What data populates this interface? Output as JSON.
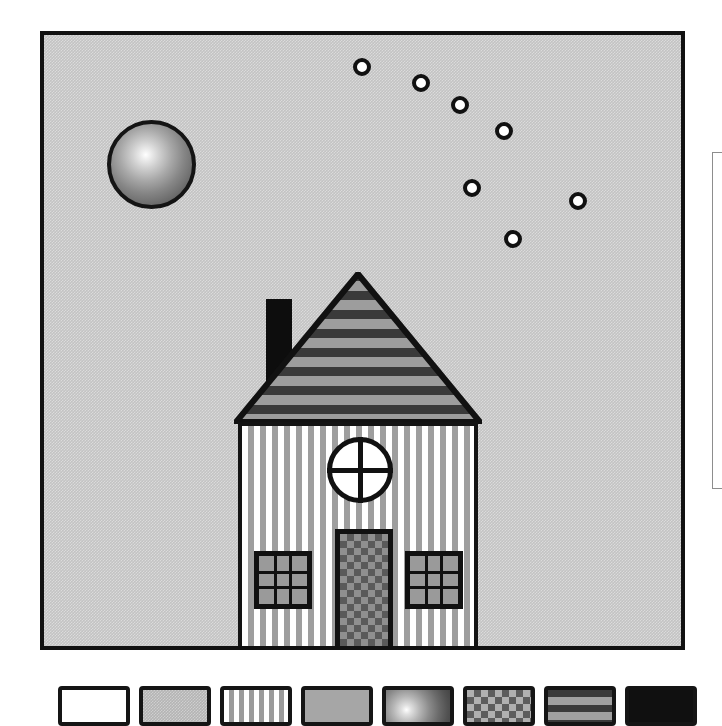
{
  "app": {
    "title": "Drawing Canvas",
    "canvas_bg_color": "#c3c3c3",
    "outline_color": "#111111",
    "paper_color": "#ffffff"
  },
  "canvas": {
    "name": "house-scene",
    "description": "House with striped roof, vertical-striped walls, checkered door, sun sphere and arc of bubbles",
    "bounds": {
      "x": 40,
      "y": 31,
      "width": 645,
      "height": 619
    }
  },
  "scene": {
    "sphere": {
      "label": "sun-sphere",
      "center_x": 107,
      "center_y": 129,
      "radius": 44,
      "fill": "radial-gradient",
      "highlight_color": "#ffffff",
      "shadow_color": "#4c4c4c",
      "stroke": "#141414"
    },
    "bubbles": {
      "label": "bubble-arc",
      "count": 7,
      "fill": "#ffffff",
      "stroke": "#111111",
      "radius": 9,
      "points": [
        {
          "id": "bubble-1",
          "x": 358,
          "y": 63
        },
        {
          "id": "bubble-2",
          "x": 417,
          "y": 79
        },
        {
          "id": "bubble-3",
          "x": 456,
          "y": 101
        },
        {
          "id": "bubble-4",
          "x": 500,
          "y": 127
        },
        {
          "id": "bubble-5",
          "x": 468,
          "y": 184
        },
        {
          "id": "bubble-6",
          "x": 574,
          "y": 197
        },
        {
          "id": "bubble-7",
          "x": 509,
          "y": 235
        }
      ]
    },
    "house": {
      "label": "house",
      "roof": {
        "label": "roof",
        "pattern": "horizontal-stripes",
        "dark_color": "#3a3a3a",
        "light_color": "#9d9d9d",
        "apex_x": 361,
        "apex_y": 268,
        "base_y": 420,
        "left_x": 230,
        "right_x": 478
      },
      "chimney": {
        "label": "chimney",
        "fill": "#0d0d0d",
        "x": 262,
        "y": 295,
        "width": 26,
        "height": 95
      },
      "walls": {
        "label": "house-body",
        "pattern": "vertical-stripes",
        "stripe_color": "#9e9e9e",
        "gap_color": "#ffffff",
        "x": 234,
        "y": 418,
        "width": 240,
        "height": 232
      },
      "round_window": {
        "label": "round-window",
        "center_x": 356,
        "center_y": 468,
        "radius": 33,
        "mullions": "cross",
        "fill": "#ffffff"
      },
      "door": {
        "label": "front-door",
        "pattern": "checkerboard",
        "light_color": "#8f8f8f",
        "dark_color": "#5a5a5a",
        "x": 331,
        "y": 525,
        "width": 58,
        "height": 125
      },
      "windows": [
        {
          "label": "window-left",
          "x": 250,
          "y": 547,
          "width": 58,
          "height": 58,
          "panes": 9,
          "fill": "#9a9a9a"
        },
        {
          "label": "window-right",
          "x": 401,
          "y": 547,
          "width": 58,
          "height": 58,
          "panes": 9,
          "fill": "#9a9a9a"
        }
      ]
    }
  },
  "palette": {
    "label": "pattern-palette",
    "swatch_count": 8,
    "swatches": [
      {
        "id": "swatch-solid-white",
        "name": "solid-white",
        "x": 58,
        "color": "#ffffff"
      },
      {
        "id": "swatch-light-gray",
        "name": "light-gray-grain",
        "x": 139,
        "color": "#b4b4b4"
      },
      {
        "id": "swatch-vstripes",
        "name": "vertical-stripes",
        "x": 220,
        "color": "#9b9b9b"
      },
      {
        "id": "swatch-mid-gray",
        "name": "mid-gray",
        "x": 301,
        "color": "#a6a6a6"
      },
      {
        "id": "swatch-gradient",
        "name": "sphere-gradient",
        "x": 382,
        "color": "#8b8b8b"
      },
      {
        "id": "swatch-checker",
        "name": "checkerboard",
        "x": 463,
        "color": "#5d5d5d"
      },
      {
        "id": "swatch-hstripes",
        "name": "horizontal-stripes",
        "x": 544,
        "color": "#3a3a3a"
      },
      {
        "id": "swatch-black",
        "name": "solid-black",
        "x": 625,
        "color": "#101010"
      }
    ]
  },
  "side_panel": {
    "label": "right-panel-edge",
    "x": 712,
    "y": 152,
    "width": 10,
    "height": 337,
    "background": "#ffffff"
  }
}
